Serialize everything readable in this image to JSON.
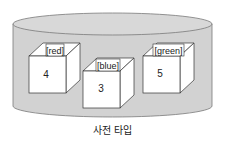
{
  "diagram": {
    "caption": "사전 타입",
    "container": {
      "shape": "cylinder",
      "fill": "#d4d4d4",
      "stroke": "#777777"
    },
    "items": [
      {
        "key": "[red]",
        "value": "4"
      },
      {
        "key": "[blue]",
        "value": "3"
      },
      {
        "key": "[green]",
        "value": "5"
      }
    ]
  }
}
